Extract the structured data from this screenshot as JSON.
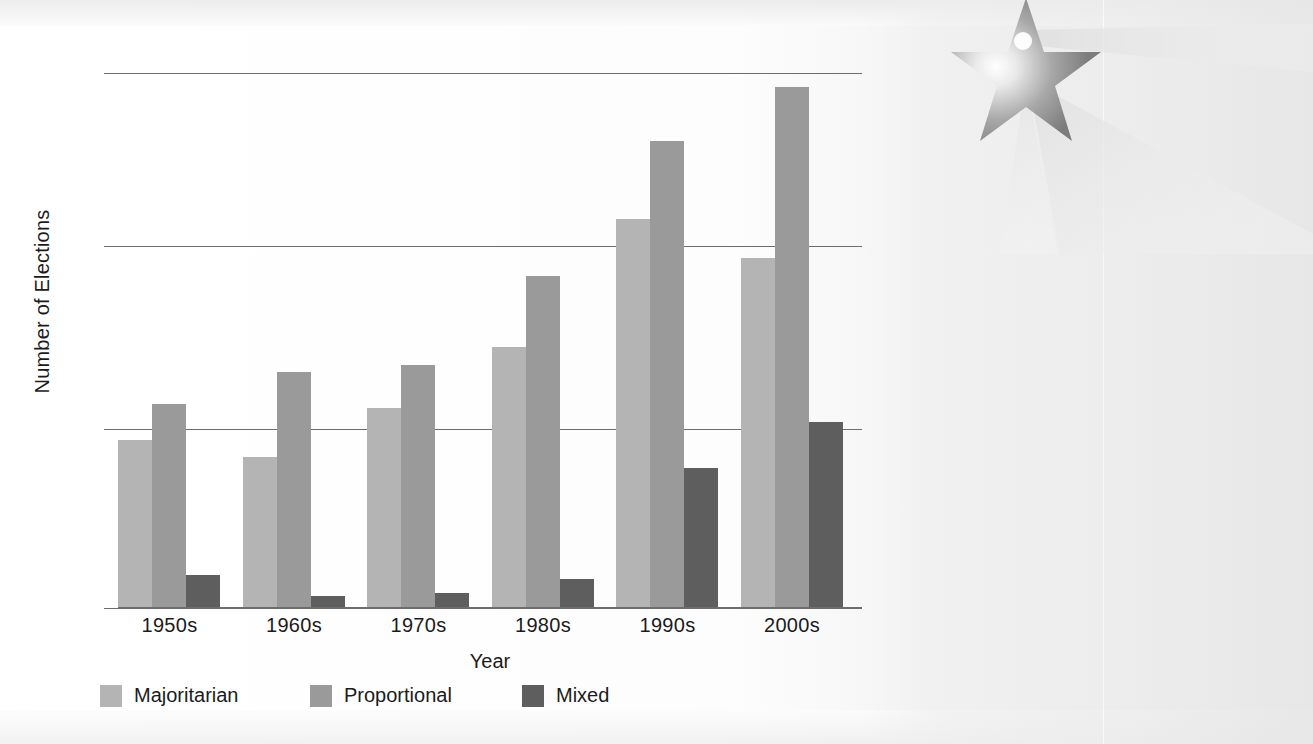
{
  "chart_data": {
    "type": "bar",
    "title": "",
    "xlabel": "Year",
    "ylabel": "Number of Elections",
    "categories": [
      "1950s",
      "1960s",
      "1970s",
      "1980s",
      "1990s",
      "2000s"
    ],
    "series": [
      {
        "name": "Majoritarian",
        "color": "#b4b4b4",
        "values": [
          47,
          42,
          56,
          73,
          109,
          98
        ]
      },
      {
        "name": "Proportional",
        "color": "#9a9a9a",
        "values": [
          57,
          66,
          68,
          93,
          131,
          146
        ]
      },
      {
        "name": "Mixed",
        "color": "#5e5e5e",
        "values": [
          9,
          3,
          4,
          8,
          39,
          52
        ]
      }
    ],
    "ylim": [
      0,
      150
    ],
    "yticks": [
      0,
      50,
      100,
      150
    ],
    "ytick_labels": [
      "0",
      "50",
      "100",
      "150"
    ],
    "grid": true,
    "legend_position": "bottom-left"
  },
  "axes": {
    "y_label": "Number of Elections",
    "x_label": "Year",
    "y_ticks": [
      {
        "label": "150",
        "value": 150
      },
      {
        "label": "100",
        "value": 100
      },
      {
        "label": "50",
        "value": 50
      },
      {
        "label": "0",
        "value": 0
      }
    ],
    "x_ticks": [
      "1950s",
      "1960s",
      "1970s",
      "1980s",
      "1990s",
      "2000s"
    ]
  },
  "legend": {
    "items": [
      {
        "label": "Majoritarian",
        "color": "#b4b4b4"
      },
      {
        "label": "Proportional",
        "color": "#9a9a9a"
      },
      {
        "label": "Mixed",
        "color": "#5e5e5e"
      }
    ]
  },
  "decoration": {
    "star_icon": "star-watermark",
    "description": "faint shooting-star graphic bleeding through from facing page"
  }
}
